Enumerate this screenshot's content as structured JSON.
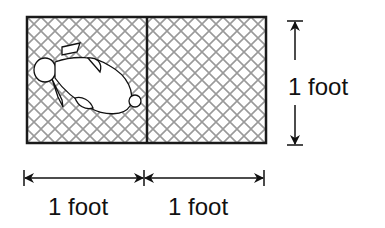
{
  "diagram": {
    "cells": [
      {
        "name": "left-cell",
        "content": "rabbit",
        "pattern": "wire-mesh"
      },
      {
        "name": "right-cell",
        "content": "empty",
        "pattern": "wire-mesh"
      }
    ],
    "dimensions": {
      "height_label": "1 foot",
      "width_labels": [
        "1 foot",
        "1 foot"
      ]
    },
    "colors": {
      "line": "#1a1a1a",
      "mesh": "#9a9a9a",
      "background": "#ffffff"
    }
  }
}
